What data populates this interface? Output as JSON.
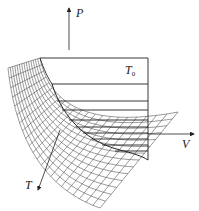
{
  "figure": {
    "type": "3d-surface-diagram",
    "axes": {
      "p_label": "P",
      "v_label": "V",
      "t_label": "T"
    },
    "isotherm_label": {
      "main": "T",
      "subscript": "0"
    },
    "colors": {
      "line": "#222222",
      "mesh": "#444444",
      "background": "#ffffff"
    }
  }
}
